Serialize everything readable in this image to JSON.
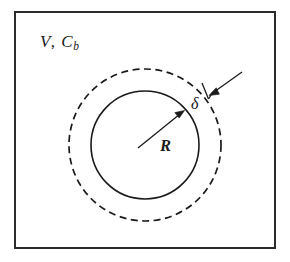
{
  "figure": {
    "background_color": "#ffffff",
    "ink_color": "#1a1a1a",
    "frame": {
      "name": "bulk-fluid-domain",
      "x": 14,
      "y": 11,
      "width": 262,
      "height": 238,
      "stroke_color": "#2b2b2b",
      "stroke_width": 2
    },
    "labels": {
      "bulk": {
        "text": "V, C",
        "variable_volume": "V",
        "comma": ",",
        "variable_concentration": "C",
        "subscript": "b",
        "full": "V, Cb"
      },
      "radius": {
        "text": "R",
        "meaning": "sphere-radius"
      },
      "delta": {
        "text": "δ",
        "meaning": "boundary-layer-thickness"
      }
    },
    "shapes": {
      "inner_circle": {
        "name": "sphere-boundary",
        "cx": 145,
        "cy": 145,
        "r": 54,
        "style": "solid"
      },
      "outer_circle": {
        "name": "boundary-layer-edge",
        "cx": 145,
        "cy": 145,
        "r": 76,
        "style": "dashed",
        "dash_pattern": "7 4.5"
      }
    },
    "annotations": {
      "radius_arrow": {
        "name": "radius-arrow",
        "from_x": 139,
        "from_y": 147,
        "to_x": 183,
        "to_y": 112
      },
      "delta_arrow": {
        "name": "delta-arrow",
        "from_x": 241,
        "from_y": 73,
        "to_x": 210,
        "to_y": 95
      },
      "delta_tick": {
        "name": "delta-tick",
        "from_x": 203,
        "from_y": 84,
        "to_x": 209,
        "to_y": 99
      }
    }
  }
}
